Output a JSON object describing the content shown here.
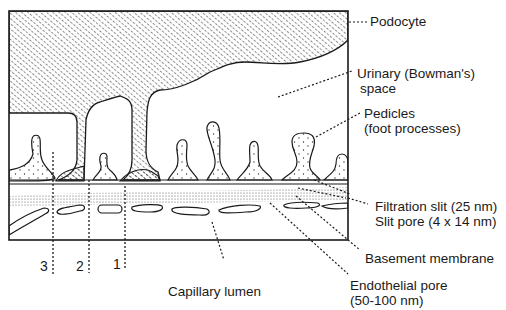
{
  "diagram": {
    "type": "glomerular-filtration-barrier",
    "labels": {
      "podocyte": "Podocyte",
      "urinary_space_line1": "Urinary (Bowman's)",
      "urinary_space_line2": "space",
      "pedicles_line1": "Pedicles",
      "pedicles_line2": "(foot processes)",
      "filtration_slit": "Filtration slit (25 nm)",
      "slit_pore": "Slit pore (4 x 14 nm)",
      "basement_membrane": "Basement membrane",
      "endothelial_pore_line1": "Endothelial pore",
      "endothelial_pore_line2": "(50-100 nm)",
      "capillary_lumen": "Capillary lumen"
    },
    "pathway_markers": [
      "3",
      "2",
      "1"
    ],
    "colors": {
      "line": "#1a1a1a",
      "background": "#ffffff"
    }
  }
}
